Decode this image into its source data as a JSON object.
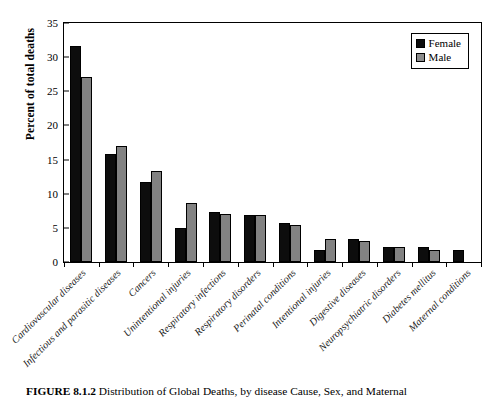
{
  "chart_data": {
    "type": "bar",
    "title": "",
    "xlabel": "",
    "ylabel": "Percent of total deaths",
    "ylim": [
      0,
      35
    ],
    "ytick_step": 5,
    "yticks": [
      "0",
      "5",
      "10",
      "15",
      "20",
      "25",
      "30",
      "35"
    ],
    "grid": false,
    "legend_position": "top-right",
    "categories": [
      "Cardiovascular diseases",
      "Infectious and parasitic diseases",
      "Cancers",
      "Unintentional injuries",
      "Respiratory infections",
      "Respiratory disorders",
      "Perinatal conditions",
      "Intentional injuries",
      "Digestive diseases",
      "Neuropsychiatric disorders",
      "Diabetes mellitus",
      "Maternal conditions"
    ],
    "series": [
      {
        "name": "Female",
        "color": "#0d0d0d",
        "values": [
          31.4,
          15.7,
          11.6,
          4.9,
          7.3,
          6.9,
          5.7,
          1.7,
          3.4,
          2.2,
          2.2,
          1.8
        ]
      },
      {
        "name": "Male",
        "color": "#828282",
        "values": [
          26.9,
          16.8,
          13.2,
          8.5,
          7.0,
          6.9,
          5.4,
          3.3,
          3.0,
          2.2,
          1.7,
          null
        ]
      }
    ]
  },
  "legend": {
    "entries": [
      {
        "label": "Female"
      },
      {
        "label": "Male"
      }
    ]
  },
  "caption": {
    "figure_number": "FIGURE 8.1.2",
    "text": "Distribution of Global Deaths, by disease Cause, Sex, and Maternal"
  }
}
